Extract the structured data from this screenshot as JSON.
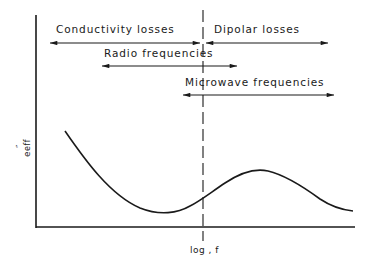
{
  "diagram": {
    "type": "schematic_curve",
    "x_axis_label": "log , f",
    "y_axis_label": "e″eff",
    "y_axis_label_parts": {
      "base": "e",
      "sup": "″",
      "sub": "eff"
    },
    "regions": [
      {
        "label": "Conductivity losses",
        "arrow": "bidirectional",
        "x_from": 50,
        "x_to": 200,
        "y": 43
      },
      {
        "label": "Dipolar losses",
        "arrow": "bidirectional",
        "x_from": 205,
        "x_to": 328,
        "y": 43
      },
      {
        "label": "Radio frequencies",
        "arrow": "bidirectional",
        "x_from": 102,
        "x_to": 237,
        "y": 66
      },
      {
        "label": "Microwave frequencies",
        "arrow": "bidirectional",
        "x_from": 183,
        "x_to": 333,
        "y": 95
      }
    ],
    "divider": {
      "style": "dashed",
      "x": 203
    },
    "curve": {
      "description": "Effective loss factor vs log frequency: decreasing from left, minimum, then a peak, then decreasing",
      "points": [
        [
          65,
          131
        ],
        [
          100,
          172
        ],
        [
          130,
          200
        ],
        [
          162,
          213
        ],
        [
          185,
          209
        ],
        [
          203,
          197
        ],
        [
          230,
          178
        ],
        [
          258,
          170
        ],
        [
          285,
          178
        ],
        [
          320,
          198
        ],
        [
          353,
          210
        ]
      ]
    },
    "colors": {
      "ink": "#1a1a1a",
      "background": "#ffffff"
    }
  }
}
